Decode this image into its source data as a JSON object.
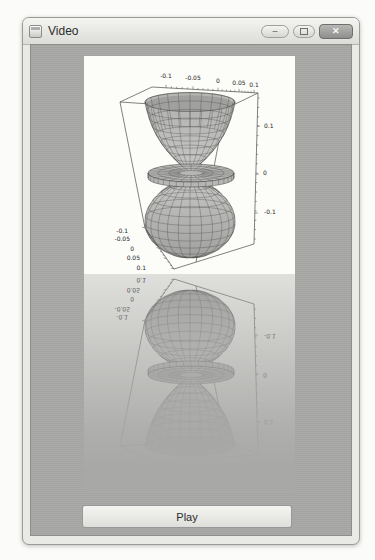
{
  "window": {
    "title": "Video",
    "controls": {
      "minimize_glyph": "–",
      "close_glyph": "✕"
    }
  },
  "plot": {
    "x_ticks": [
      "-0.1",
      "-0.05",
      "0",
      "0.05",
      "0.1"
    ],
    "y_ticks": [
      "-0.1",
      "-0.05",
      "0",
      "0.05",
      "0.1"
    ],
    "z_ticks": [
      "0.1",
      "0",
      "-0.1"
    ]
  },
  "controls": {
    "play_label": "Play"
  },
  "chart_data": {
    "type": "3d-surface",
    "title": "",
    "x_ticks": [
      -0.1,
      -0.05,
      0,
      0.05,
      0.1
    ],
    "y_ticks": [
      -0.1,
      -0.05,
      0,
      0.05,
      0.1
    ],
    "z_ticks": [
      0.1,
      0,
      -0.1
    ],
    "x_range": [
      -0.12,
      0.12
    ],
    "y_range": [
      -0.12,
      0.12
    ],
    "z_range": [
      -0.15,
      0.15
    ],
    "grid": false,
    "legend": "none"
  }
}
